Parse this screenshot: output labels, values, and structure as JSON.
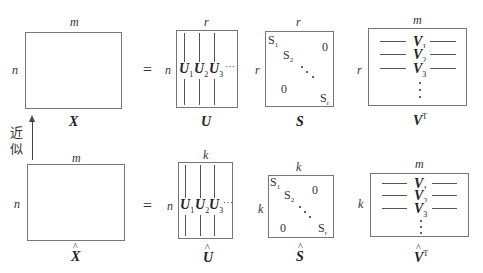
{
  "top_row": {
    "X": {
      "name": "X",
      "width_label": "m",
      "height_label": "n"
    },
    "equals": "=",
    "U": {
      "name": "U",
      "width_label": "r",
      "height_label": "n",
      "columns": [
        {
          "sym": "U",
          "sub": "1"
        },
        {
          "sym": "U",
          "sub": "2"
        },
        {
          "sym": "U",
          "sub": "3"
        }
      ],
      "ellipsis": "···"
    },
    "S": {
      "name": "S",
      "width_label": "r",
      "height_label": "r",
      "entries": {
        "s1": "S",
        "s1_sub": "1",
        "s2": "S",
        "s2_sub": "2",
        "sr": "S",
        "sr_sub": "r",
        "upper_zero": "0",
        "lower_zero": "0"
      }
    },
    "V": {
      "name": "V",
      "sup": "T",
      "width_label": "m",
      "height_label": "r",
      "rows": [
        {
          "sym": "V",
          "sub": "1"
        },
        {
          "sym": "V",
          "sub": "2"
        },
        {
          "sym": "V",
          "sub": "3"
        }
      ]
    }
  },
  "approx_arrow": {
    "label_line1": "近",
    "label_line2": "似"
  },
  "bottom_row": {
    "X_hat": {
      "name": "X",
      "width_label": "m",
      "height_label": "n"
    },
    "equals": "=",
    "U_hat": {
      "name": "U",
      "width_label": "k",
      "height_label": "n",
      "columns": [
        {
          "sym": "U",
          "sub": "1"
        },
        {
          "sym": "U",
          "sub": "2"
        },
        {
          "sym": "U",
          "sub": "3"
        }
      ],
      "ellipsis": "···"
    },
    "S_hat": {
      "name": "S",
      "width_label": "k",
      "height_label": "k",
      "entries": {
        "s1": "S",
        "s1_sub": "1",
        "s2": "S",
        "s2_sub": "2",
        "sr": "S",
        "sr_sub": "r",
        "upper_zero": "0",
        "lower_zero": "0"
      }
    },
    "V_hat": {
      "name": "V",
      "sup": "T",
      "width_label": "m",
      "height_label": "k",
      "rows": [
        {
          "sym": "V",
          "sub": "1"
        },
        {
          "sym": "V",
          "sub": "2"
        },
        {
          "sym": "V",
          "sub": "3"
        }
      ]
    }
  }
}
